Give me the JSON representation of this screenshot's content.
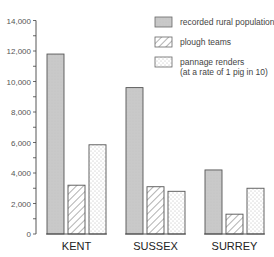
{
  "chart_data": {
    "type": "bar",
    "title": "",
    "xlabel": "",
    "ylabel": "",
    "categories": [
      "KENT",
      "SUSSEX",
      "SURREY"
    ],
    "series": [
      {
        "name": "recorded rural population",
        "pattern": "solid-grey",
        "color": "#c8c8c8",
        "values": [
          11800,
          9600,
          4200
        ]
      },
      {
        "name": "plough teams",
        "pattern": "hatched",
        "color": "#ffffff",
        "values": [
          3200,
          3100,
          1300
        ]
      },
      {
        "name": "pannage renders (at a rate of 1 pig in 10)",
        "pattern": "dotted",
        "color": "#ffffff",
        "values": [
          5850,
          2800,
          3000
        ]
      }
    ],
    "ylim": [
      0,
      14000
    ],
    "yticks": [
      0,
      2000,
      4000,
      6000,
      8000,
      10000,
      12000,
      14000
    ],
    "ytick_labels": [
      "0",
      "2,000",
      "4,000",
      "6,000",
      "8,000",
      "10,000",
      "12,000",
      "14,000"
    ],
    "minor_tick_step": 1000,
    "grid": false,
    "legend_position": "top-right"
  },
  "legend": {
    "items": [
      {
        "label_lines": [
          "recorded rural population"
        ]
      },
      {
        "label_lines": [
          "plough teams"
        ]
      },
      {
        "label_lines": [
          "pannage renders",
          "(at a rate of 1 pig in 10)"
        ]
      }
    ]
  }
}
